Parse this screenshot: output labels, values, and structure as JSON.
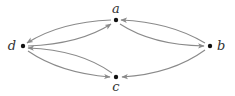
{
  "diagram": {
    "type": "directed-graph",
    "edge_color": "#8a8a8a",
    "node_color": "#111111",
    "label_color": "#333333",
    "nodes": [
      {
        "id": "a",
        "label": "a",
        "x": 116,
        "y": 20,
        "label_x": 116,
        "label_y": 13,
        "anchor": "middle"
      },
      {
        "id": "b",
        "label": "b",
        "x": 210,
        "y": 46,
        "label_x": 217,
        "label_y": 50,
        "anchor": "start"
      },
      {
        "id": "c",
        "label": "c",
        "x": 116,
        "y": 77,
        "label_x": 116,
        "label_y": 91,
        "anchor": "middle"
      },
      {
        "id": "d",
        "label": "d",
        "x": 23,
        "y": 46,
        "label_x": 16,
        "label_y": 50,
        "anchor": "end"
      }
    ],
    "edges": [
      {
        "from": "a",
        "to": "d",
        "arc": "upper"
      },
      {
        "from": "d",
        "to": "a",
        "arc": "lower"
      },
      {
        "from": "c",
        "to": "d",
        "arc": "upper"
      },
      {
        "from": "d",
        "to": "c",
        "arc": "lower"
      },
      {
        "from": "b",
        "to": "a",
        "arc": "upper"
      },
      {
        "from": "a",
        "to": "b",
        "arc": "lower"
      },
      {
        "from": "b",
        "to": "c",
        "arc": "single"
      }
    ]
  }
}
